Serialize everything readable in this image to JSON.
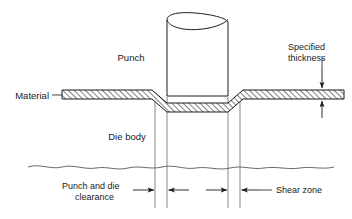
{
  "figure": {
    "type": "engineering-cross-section-diagram",
    "width": 352,
    "height": 219,
    "background_color": "#ffffff",
    "line_color": "#1a1a1a",
    "text_color": "#1a1a1a"
  },
  "labels": {
    "punch": "Punch",
    "material": "Material",
    "die_body": "Die body",
    "specified_thickness_line1": "Specified",
    "specified_thickness_line2": "thickness",
    "punch_and_die_clearance_line1": "Punch and die",
    "punch_and_die_clearance_line2": "clearance",
    "shear_zone": "Shear zone"
  },
  "components": {
    "punch": {
      "name": "punch",
      "description": "Cylindrical punch tool with broken-off top shown by crossed ellipse",
      "left_x": 167,
      "right_x": 228,
      "top_y": 14,
      "bottom_y": 96
    },
    "material": {
      "name": "material-sheet",
      "description": "Hatched sheet metal strip deformed downward under the punch",
      "surface_y": 92,
      "thickness_px": 9
    },
    "die_body": {
      "name": "die-body",
      "description": "Region below the material bounded by a wavy break line",
      "break_line_y": 165
    },
    "clearance_lines": {
      "description": "Vertical reference lines marking punch and die clearance boundaries",
      "x_positions": [
        155,
        167,
        228,
        240
      ]
    }
  },
  "dimensions": [
    {
      "name": "punch-and-die-clearance-left",
      "label": "Punch and die clearance",
      "arrow_direction": "right",
      "from_x": 140,
      "to_x": 155,
      "y": 190
    },
    {
      "name": "shear-zone-span",
      "label": "Shear zone",
      "arrow_direction": "left",
      "from_x": 185,
      "to_x": 168,
      "y": 190
    },
    {
      "name": "shear-zone-span-right",
      "label": "Shear zone",
      "arrow_direction": "right",
      "from_x": 212,
      "to_x": 227,
      "y": 190
    },
    {
      "name": "punch-and-die-clearance-right",
      "label": "Shear zone",
      "arrow_direction": "left",
      "from_x": 257,
      "to_x": 241,
      "y": 190
    },
    {
      "name": "specified-thickness",
      "label": "Specified thickness",
      "arrow_direction": "vertical-pair",
      "x": 322,
      "top_arrow_from_y": 68,
      "top_arrow_to_y": 90,
      "bottom_arrow_from_y": 113,
      "bottom_arrow_to_y": 101
    }
  ],
  "annotations": {
    "punch_leader": {
      "from_x": 155,
      "from_y": 57,
      "to_x": 167,
      "to_y": 57
    },
    "material_leader": {
      "from_x": 52,
      "from_y": 96,
      "to_x": 62,
      "to_y": 96
    },
    "shear_zone_leader": {
      "from_x": 258,
      "from_y": 190,
      "to_x": 272,
      "to_y": 190
    },
    "clearance_leader": {
      "from_x": 130,
      "from_y": 190,
      "to_x": 155,
      "to_y": 190
    }
  }
}
